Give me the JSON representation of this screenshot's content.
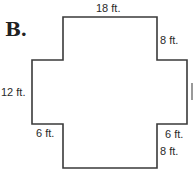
{
  "problem": {
    "letter": "B."
  },
  "shape": {
    "type": "cross-shaped polygon",
    "stroke_color": "#3a3a3a",
    "fill_color": "#ffffff"
  },
  "labels": {
    "top": "18 ft.",
    "top_right_vertical": "8 ft.",
    "left_side": "12 ft.",
    "bottom_left_step": "6 ft.",
    "bottom_right_step": "6 ft.",
    "bottom_right_vertical": "8 ft."
  }
}
